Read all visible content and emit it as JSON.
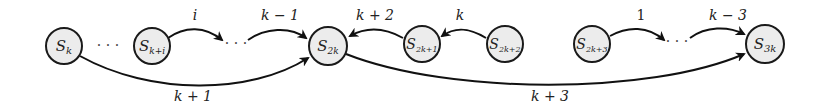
{
  "diagram": {
    "type": "state-transition-graph",
    "nodes": [
      {
        "id": "Sk",
        "base": "S",
        "sub": "k",
        "x": 64,
        "y": 46
      },
      {
        "id": "Ski",
        "base": "S",
        "sub": "k+i",
        "x": 152,
        "y": 46
      },
      {
        "id": "S2k",
        "base": "S",
        "sub": "2k",
        "x": 328,
        "y": 46
      },
      {
        "id": "S2k1",
        "base": "S",
        "sub": "2k+1",
        "x": 422,
        "y": 44
      },
      {
        "id": "S2k2",
        "base": "S",
        "sub": "2k+2",
        "x": 505,
        "y": 44
      },
      {
        "id": "S2k3",
        "base": "S",
        "sub": "2k+3",
        "x": 592,
        "y": 44
      },
      {
        "id": "S3k",
        "base": "S",
        "sub": "3k",
        "x": 765,
        "y": 44
      }
    ],
    "ellipses": [
      {
        "id": "dots1",
        "text": "···",
        "x": 108,
        "y": 48
      },
      {
        "id": "dots2",
        "text": "···",
        "x": 240,
        "y": 46
      },
      {
        "id": "dots3",
        "text": "···",
        "x": 678,
        "y": 44
      }
    ],
    "edges": [
      {
        "from": "Ski",
        "to": "dots2",
        "label": "i"
      },
      {
        "from": "dots2",
        "to": "S2k",
        "label": "k − 1"
      },
      {
        "from": "Sk",
        "to": "S2k",
        "label": "k + 1"
      },
      {
        "from": "S2k1",
        "to": "S2k",
        "label": "k + 2"
      },
      {
        "from": "S2k2",
        "to": "S2k1",
        "label": "k"
      },
      {
        "from": "S2k",
        "to": "S3k",
        "label": "k + 3"
      },
      {
        "from": "S2k3",
        "to": "dots3",
        "label": "1"
      },
      {
        "from": "dots3",
        "to": "S3k",
        "label": "k − 3"
      }
    ]
  },
  "labels": {
    "n0_base": "S",
    "n0_sub": "k",
    "n1_base": "S",
    "n1_sub": "k+i",
    "n2_base": "S",
    "n2_sub": "2k",
    "n3_base": "S",
    "n3_sub": "2k+1",
    "n4_base": "S",
    "n4_sub": "2k+2",
    "n5_base": "S",
    "n5_sub": "2k+3",
    "n6_base": "S",
    "n6_sub": "3k",
    "dots": "· · ·",
    "e_i": "i",
    "e_km1": "k − 1",
    "e_kp1": "k + 1",
    "e_kp2": "k + 2",
    "e_k": "k",
    "e_kp3": "k + 3",
    "e_1": "1",
    "e_km3": "k − 3"
  }
}
